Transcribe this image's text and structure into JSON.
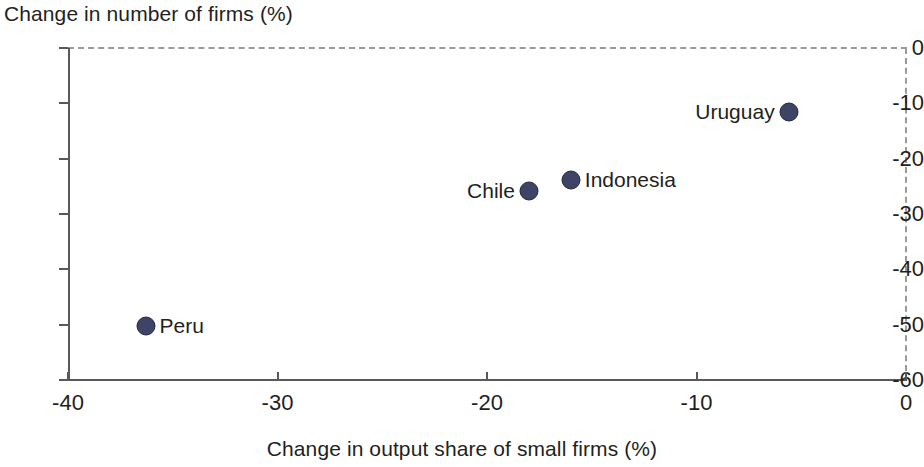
{
  "chart_data": {
    "type": "scatter",
    "title": "",
    "ylabel": "Change in number of firms (%)",
    "xlabel": "Change in output share of small firms (%)",
    "xlim": [
      -40,
      0
    ],
    "ylim": [
      -60,
      0
    ],
    "xticks": [
      "-40",
      "-30",
      "-20",
      "-10",
      "0"
    ],
    "xtick_values": [
      -40,
      -30,
      -20,
      -10,
      0
    ],
    "yticks": [
      "0",
      "-10",
      "-20",
      "-30",
      "-40",
      "-50",
      "-60"
    ],
    "ytick_values": [
      0,
      -10,
      -20,
      -30,
      -40,
      -50,
      -60
    ],
    "grid": false,
    "legend": "none",
    "marker_color": "#3d4466",
    "marker_edge_color": "#23263d",
    "axis_color": "#58595b",
    "boundary_style": "dashed at x=0 and y=0",
    "points": [
      {
        "label": "Peru",
        "x": -36.3,
        "y": -50.3,
        "label_side": "right"
      },
      {
        "label": "Chile",
        "x": -18.0,
        "y": -25.9,
        "label_side": "left"
      },
      {
        "label": "Indonesia",
        "x": -16.0,
        "y": -23.9,
        "label_side": "right"
      },
      {
        "label": "Uruguay",
        "x": -5.6,
        "y": -11.6,
        "label_side": "left"
      }
    ]
  }
}
